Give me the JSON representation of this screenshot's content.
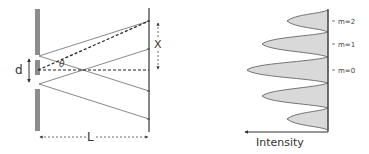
{
  "diagram": {
    "left_panel": {
      "labels": {
        "slit_separation": "d",
        "angle": "θ",
        "fringe_position": "X",
        "screen_distance": "L"
      }
    },
    "right_panel": {
      "axis_label": "Intensity",
      "orders": [
        {
          "label": "m=2",
          "relative_intensity": 0.3
        },
        {
          "label": "m=1",
          "relative_intensity": 0.6
        },
        {
          "label": "m=0",
          "relative_intensity": 1.0
        }
      ],
      "fill_color": "#d9d9d9",
      "stroke_color": "#555555"
    },
    "colors": {
      "barrier": "#8c8c8c",
      "lines": "#444444",
      "background": "#ffffff"
    }
  }
}
